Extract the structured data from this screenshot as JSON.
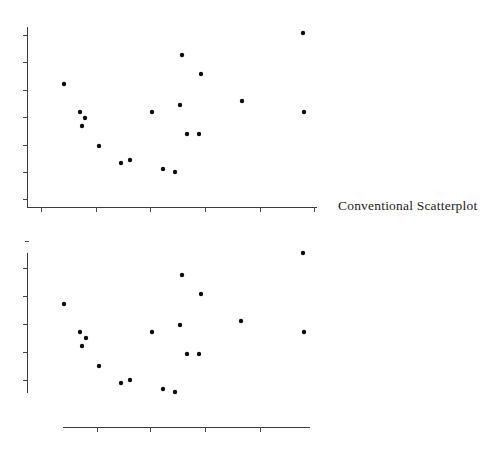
{
  "figure": {
    "title": "",
    "panels": [
      {
        "id": "conventional",
        "label": "Conventional Scatterplot"
      },
      {
        "id": "rangeframe",
        "label": "Range-Frame"
      }
    ]
  },
  "labels": {
    "conventional": "Conventional Scatterplot",
    "rangeframe": "Range-Frame"
  },
  "colors": {
    "background": "#ffffff",
    "axis": "#3b3b3b",
    "tick": "#4a4a4a",
    "point": "#0d0d0d",
    "text": "#1c1c1c"
  },
  "chart_data": [
    {
      "type": "scatter",
      "title": "Conventional Scatterplot",
      "xlabel": "",
      "ylabel": "",
      "grid": false,
      "legend": "none",
      "frame_style": "conventional",
      "xlim": [
        0,
        10
      ],
      "ylim": [
        0,
        10
      ],
      "xticks": [
        1,
        2,
        3,
        4,
        5,
        6
      ],
      "yticks": [
        1,
        2,
        3,
        4,
        5,
        6,
        7
      ],
      "x": [
        1.28,
        1.86,
        1.96,
        1.89,
        2.5,
        2.92,
        3.69,
        3.26,
        4.55,
        4.78,
        5.0,
        5.18,
        5.26,
        5.69,
        5.72,
        6.0,
        6.36,
        7.5,
        9.7,
        9.73
      ],
      "y": [
        6.7,
        5.2,
        4.9,
        4.5,
        3.4,
        2.8,
        2.8,
        1.95,
        5.25,
        8.55,
        4.1,
        3.3,
        1.8,
        3.3,
        7.6,
        6.2,
        5.55,
        5.6,
        8.95,
        4.8
      ],
      "points": [
        {
          "px": 64,
          "py": 84
        },
        {
          "px": 80,
          "py": 112
        },
        {
          "px": 85,
          "py": 118
        },
        {
          "px": 82,
          "py": 126
        },
        {
          "px": 99,
          "py": 146
        },
        {
          "px": 121,
          "py": 163
        },
        {
          "px": 130,
          "py": 160
        },
        {
          "px": 152,
          "py": 112
        },
        {
          "px": 163,
          "py": 169
        },
        {
          "px": 175,
          "py": 172
        },
        {
          "px": 180,
          "py": 105
        },
        {
          "px": 182,
          "py": 55
        },
        {
          "px": 187,
          "py": 134
        },
        {
          "px": 199,
          "py": 134
        },
        {
          "px": 201,
          "py": 74
        },
        {
          "px": 242,
          "py": 101
        },
        {
          "px": 303,
          "py": 33
        },
        {
          "px": 304,
          "py": 112
        }
      ]
    },
    {
      "type": "scatter",
      "title": "Range-Frame",
      "xlabel": "",
      "ylabel": "",
      "grid": false,
      "legend": "none",
      "frame_style": "range-frame",
      "xlim": [
        0,
        10
      ],
      "ylim": [
        0,
        10
      ],
      "xticks": [
        1,
        2,
        3,
        4
      ],
      "yticks": [
        1,
        2,
        3,
        4,
        5
      ],
      "x": [
        1.28,
        1.86,
        1.96,
        1.89,
        2.5,
        2.92,
        3.69,
        3.26,
        4.55,
        4.78,
        5.0,
        5.18,
        5.26,
        5.69,
        5.72,
        6.0,
        6.36,
        7.5,
        9.7,
        9.73
      ],
      "y": [
        6.7,
        5.2,
        4.9,
        4.5,
        3.4,
        2.8,
        2.8,
        1.95,
        5.25,
        8.55,
        4.1,
        3.3,
        1.8,
        3.3,
        7.6,
        6.2,
        5.55,
        5.6,
        8.95,
        4.8
      ],
      "points": [
        {
          "px": 64,
          "py": 304
        },
        {
          "px": 80,
          "py": 332
        },
        {
          "px": 86,
          "py": 338
        },
        {
          "px": 82,
          "py": 346
        },
        {
          "px": 99,
          "py": 366
        },
        {
          "px": 121,
          "py": 383
        },
        {
          "px": 130,
          "py": 380
        },
        {
          "px": 152,
          "py": 332
        },
        {
          "px": 163,
          "py": 389
        },
        {
          "px": 175,
          "py": 392
        },
        {
          "px": 180,
          "py": 325
        },
        {
          "px": 182,
          "py": 275
        },
        {
          "px": 187,
          "py": 354
        },
        {
          "px": 199,
          "py": 354
        },
        {
          "px": 201,
          "py": 294
        },
        {
          "px": 241,
          "py": 321
        },
        {
          "px": 303,
          "py": 253
        },
        {
          "px": 304,
          "py": 332
        }
      ]
    }
  ],
  "axes": {
    "conventional": {
      "y_axis": {
        "x": 27,
        "y_top": 27,
        "y_bottom": 207
      },
      "x_axis": {
        "y": 207,
        "x_left": 27,
        "x_right": 317
      },
      "y_tick_positions": [
        35,
        62,
        90,
        117,
        145,
        172,
        199
      ],
      "x_tick_positions": [
        41,
        96,
        150,
        205,
        260,
        314
      ]
    },
    "rangeframe": {
      "y_axis": {
        "x": 27,
        "y_top": 253,
        "y_bottom": 393
      },
      "x_axis": {
        "y": 427,
        "x_left": 63,
        "x_right": 310
      },
      "y_tick_positions": [
        268,
        296,
        324,
        352,
        380
      ],
      "x_tick_positions": [
        97,
        150,
        205,
        260
      ],
      "y_cap_marker": {
        "x": 27,
        "y": 241
      }
    }
  }
}
